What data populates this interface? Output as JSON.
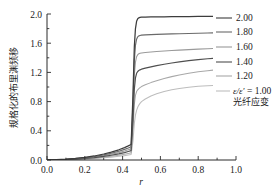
{
  "chart_data": {
    "type": "line",
    "title": "",
    "xlabel": "r",
    "ylabel": "规格化的布里渊频移",
    "xlim": [
      0.0,
      1.0
    ],
    "ylim": [
      0.0,
      2.0
    ],
    "xticks": [
      "0.0",
      "0.2",
      "0.4",
      "0.6",
      "0.8",
      "1.0"
    ],
    "xtick_values": [
      0.0,
      0.2,
      0.4,
      0.6,
      0.8,
      1.0
    ],
    "yticks": [
      "0.0",
      "0.4",
      "0.8",
      "1.2",
      "1.6",
      "2.0"
    ],
    "ytick_values": [
      0.0,
      0.4,
      0.8,
      1.2,
      1.6,
      2.0
    ],
    "minor_ticks": true,
    "grid": false,
    "legend_position": "right-outside",
    "frame": "left-bottom-only",
    "x": [
      0.0,
      0.05,
      0.1,
      0.15,
      0.2,
      0.25,
      0.3,
      0.34,
      0.38,
      0.41,
      0.43,
      0.445,
      0.455,
      0.462,
      0.468,
      0.474,
      0.48,
      0.486,
      0.492,
      0.5,
      0.52,
      0.55,
      0.58,
      0.62,
      0.66,
      0.7,
      0.75,
      0.8,
      0.85,
      0.9,
      0.95,
      1.0
    ],
    "series": [
      {
        "name": "2.00",
        "label": "2.00",
        "color": "#3d3d3d",
        "width": 1.25,
        "values": [
          0.0,
          0.005,
          0.012,
          0.022,
          0.035,
          0.055,
          0.082,
          0.108,
          0.14,
          0.17,
          0.193,
          0.212,
          0.9,
          1.55,
          1.8,
          1.9,
          1.935,
          1.948,
          1.953,
          1.956,
          1.958,
          1.96,
          1.961,
          1.962,
          1.963,
          1.964,
          1.965,
          1.966,
          1.967,
          1.968,
          1.969,
          1.97
        ]
      },
      {
        "name": "1.80",
        "label": "1.80",
        "color": "#6a6a6a",
        "width": 1.15,
        "values": [
          0.0,
          0.004,
          0.01,
          0.019,
          0.03,
          0.047,
          0.07,
          0.092,
          0.119,
          0.145,
          0.165,
          0.181,
          0.78,
          1.36,
          1.57,
          1.655,
          1.687,
          1.7,
          1.706,
          1.71,
          1.714,
          1.718,
          1.721,
          1.724,
          1.727,
          1.73,
          1.733,
          1.736,
          1.739,
          1.742,
          1.745,
          1.748
        ]
      },
      {
        "name": "1.60",
        "label": "1.60",
        "color": "#9a9a9a",
        "width": 1.05,
        "values": [
          0.0,
          0.003,
          0.008,
          0.016,
          0.026,
          0.04,
          0.059,
          0.078,
          0.101,
          0.123,
          0.14,
          0.153,
          0.66,
          1.16,
          1.34,
          1.415,
          1.443,
          1.455,
          1.461,
          1.466,
          1.472,
          1.479,
          1.485,
          1.492,
          1.499,
          1.505,
          1.512,
          1.519,
          1.525,
          1.531,
          1.536,
          1.541
        ]
      },
      {
        "name": "1.40",
        "label": "1.40",
        "color": "#4f4f4f",
        "width": 1.2,
        "values": [
          0.0,
          0.003,
          0.007,
          0.013,
          0.021,
          0.033,
          0.049,
          0.065,
          0.084,
          0.102,
          0.117,
          0.128,
          0.55,
          0.97,
          1.125,
          1.188,
          1.213,
          1.226,
          1.235,
          1.244,
          1.258,
          1.276,
          1.292,
          1.312,
          1.329,
          1.344,
          1.361,
          1.375,
          1.387,
          1.397,
          1.405,
          1.412
        ]
      },
      {
        "name": "1.20",
        "label": "1.20",
        "color": "#a8a8a8",
        "width": 1.05,
        "values": [
          0.0,
          0.002,
          0.005,
          0.01,
          0.016,
          0.025,
          0.038,
          0.05,
          0.064,
          0.078,
          0.089,
          0.098,
          0.43,
          0.76,
          0.885,
          0.938,
          0.962,
          0.978,
          0.991,
          1.006,
          1.03,
          1.06,
          1.086,
          1.116,
          1.142,
          1.163,
          1.188,
          1.208,
          1.224,
          1.237,
          1.248,
          1.256
        ]
      },
      {
        "name": "1.00",
        "label": "ε/ε' = 1.00",
        "label_plain": "1.00",
        "sublabel": "光纤应变",
        "color": "#bdbdbd",
        "width": 1.05,
        "values": [
          0.0,
          0.002,
          0.004,
          0.008,
          0.013,
          0.02,
          0.03,
          0.039,
          0.05,
          0.06,
          0.069,
          0.076,
          0.26,
          0.5,
          0.615,
          0.68,
          0.722,
          0.752,
          0.776,
          0.8,
          0.836,
          0.876,
          0.906,
          0.938,
          0.962,
          0.98,
          0.998,
          1.01,
          1.018,
          1.023,
          1.027,
          1.03
        ]
      }
    ],
    "legend_entries": [
      {
        "label": "2.00",
        "color": "#3d3d3d"
      },
      {
        "label": "1.80",
        "color": "#6a6a6a"
      },
      {
        "label": "1.60",
        "color": "#9a9a9a"
      },
      {
        "label": "1.40",
        "color": "#4f4f4f"
      },
      {
        "label": "1.20",
        "color": "#a8a8a8"
      },
      {
        "label": "ε/ε' = 1.00",
        "color": "#bdbdbd"
      }
    ],
    "annotations": [
      {
        "text": "光纤应变"
      }
    ]
  },
  "legend": {
    "entry_0": "2.00",
    "entry_1": "1.80",
    "entry_2": "1.60",
    "entry_3": "1.40",
    "entry_4": "1.20",
    "entry_5_math": "ε/ε'",
    "entry_5_eq": " = 1.00",
    "strain_note": "光纤应变"
  },
  "axes": {
    "x_title": "r",
    "y_title": "规格化的布里渊频移",
    "x_tick_0": "0.0",
    "x_tick_1": "0.2",
    "x_tick_2": "0.4",
    "x_tick_3": "0.6",
    "x_tick_4": "0.8",
    "x_tick_5": "1.0",
    "y_tick_0": "0.0",
    "y_tick_1": "0.4",
    "y_tick_2": "0.8",
    "y_tick_3": "1.2",
    "y_tick_4": "1.6",
    "y_tick_5": "2.0"
  }
}
